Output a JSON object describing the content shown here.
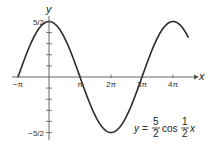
{
  "chart_data": {
    "type": "line",
    "title": "",
    "equation": {
      "lhs": "y",
      "coef_num": "5",
      "coef_den": "2",
      "func": "cos",
      "arg_num": "1",
      "arg_den": "2",
      "var": "x"
    },
    "xlabel": "x",
    "ylabel": "y",
    "x_ticks": [
      {
        "value": -3.14159,
        "label": "−π"
      },
      {
        "value": 3.14159,
        "label": "π"
      },
      {
        "value": 6.28319,
        "label": "2π"
      },
      {
        "value": 9.42478,
        "label": "3π"
      },
      {
        "value": 12.56637,
        "label": "4π"
      }
    ],
    "y_ticks": [
      {
        "value": 2.5,
        "label": "5/2"
      },
      {
        "value": -2.5,
        "label": "−5/2"
      }
    ],
    "y_minor_step": 0.5,
    "xlim": [
      -3.5,
      17.5
    ],
    "ylim": [
      -2.5,
      2.5
    ],
    "series": [
      {
        "name": "y = 5/2 cos(x/2)",
        "amplitude": 2.5,
        "frequency": 0.5,
        "x_start": -3.14159,
        "x_end": 14.1372,
        "x": [
          -3.1416,
          0,
          3.1416,
          6.2832,
          9.4248,
          12.5664,
          14.1372
        ],
        "values": [
          0,
          2.5,
          0,
          -2.5,
          0,
          2.5,
          1.77
        ]
      }
    ],
    "grid": false
  }
}
